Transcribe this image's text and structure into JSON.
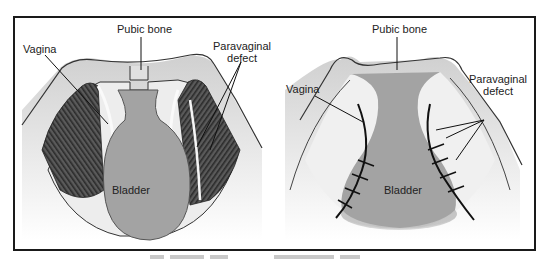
{
  "figure": {
    "left_panel": {
      "labels": {
        "pubic_bone": "Pubic bone",
        "vagina": "Vagina",
        "paravaginal_defect_line1": "Paravaginal",
        "paravaginal_defect_line2": "defect",
        "bladder": "Bladder"
      }
    },
    "right_panel": {
      "labels": {
        "pubic_bone": "Pubic bone",
        "vagina": "Vagina",
        "paravaginal_defect_line1": "Paravaginal",
        "paravaginal_defect_line2": "defect",
        "bladder": "Bladder"
      }
    },
    "colors": {
      "frame": "#1a1a1a",
      "bone": "#e6e6e6",
      "bladder": "#a3a3a3",
      "muscle_dark": "#3c3c3c",
      "suture": "#111111"
    }
  }
}
